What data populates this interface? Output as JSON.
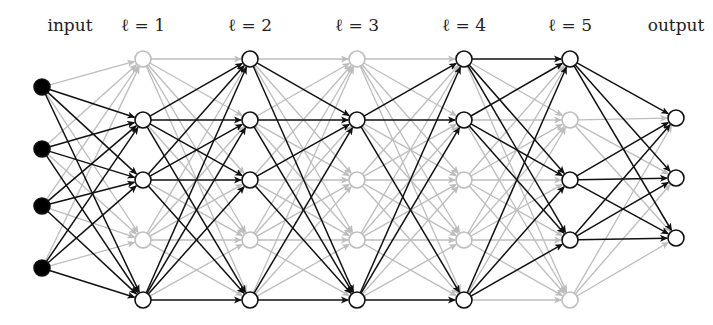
{
  "diagram": {
    "type": "neural-network-dropout",
    "colors": {
      "active": "#111111",
      "inactive": "#bdbdbd",
      "input_fill": "#000000",
      "node_fill": "#ffffff",
      "background": "#ffffff"
    },
    "labels": [
      {
        "text": "input",
        "x": 70
      },
      {
        "text": "ℓ = 1",
        "x": 143
      },
      {
        "text": "ℓ = 2",
        "x": 250
      },
      {
        "text": "ℓ = 3",
        "x": 357
      },
      {
        "text": "ℓ = 4",
        "x": 464
      },
      {
        "text": "ℓ = 5",
        "x": 570
      },
      {
        "text": "output",
        "x": 676
      }
    ],
    "layers": [
      {
        "name": "input",
        "x": 42,
        "ys": [
          87,
          149,
          206,
          268
        ],
        "active": [
          true,
          true,
          true,
          true
        ],
        "filled": true
      },
      {
        "name": "l1",
        "x": 143,
        "ys": [
          59,
          120,
          180,
          240,
          300
        ],
        "active": [
          false,
          true,
          true,
          false,
          true
        ]
      },
      {
        "name": "l2",
        "x": 250,
        "ys": [
          59,
          120,
          180,
          240,
          300
        ],
        "active": [
          true,
          true,
          true,
          false,
          true
        ]
      },
      {
        "name": "l3",
        "x": 357,
        "ys": [
          59,
          120,
          180,
          240,
          300
        ],
        "active": [
          false,
          true,
          false,
          false,
          true
        ]
      },
      {
        "name": "l4",
        "x": 464,
        "ys": [
          59,
          120,
          180,
          240,
          300
        ],
        "active": [
          true,
          true,
          false,
          false,
          true
        ]
      },
      {
        "name": "l5",
        "x": 570,
        "ys": [
          59,
          120,
          180,
          240,
          300
        ],
        "active": [
          true,
          false,
          true,
          true,
          false
        ]
      },
      {
        "name": "output",
        "x": 676,
        "ys": [
          118,
          178,
          238
        ],
        "active": [
          true,
          true,
          true
        ]
      }
    ],
    "node_radius": 8
  }
}
